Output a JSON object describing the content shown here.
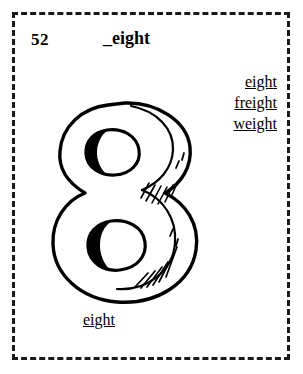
{
  "card": {
    "number": "52",
    "title": "_eight",
    "border_style": "dashed",
    "border_color": "#1a1a1a",
    "background_color": "#ffffff",
    "ink_color": "#000000"
  },
  "word_list": {
    "items": [
      {
        "label": "eight"
      },
      {
        "label": "freight"
      },
      {
        "label": "weight"
      }
    ]
  },
  "illustration": {
    "name": "numeral-eight-drawing",
    "subject": "8",
    "style": "hand-drawn line art with hatched shading",
    "stroke_color": "#000000",
    "fill_color": "#ffffff"
  },
  "answer": {
    "label": "eight"
  }
}
